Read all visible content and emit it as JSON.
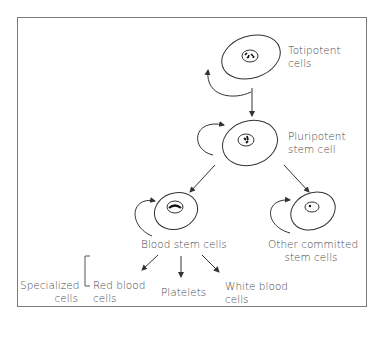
{
  "diagram": {
    "nodes": {
      "totipotent": {
        "line1": "Totipotent",
        "line2": "cells"
      },
      "pluripotent": {
        "line1": "Pluripotent",
        "line2": "stem cell"
      },
      "blood_stem": {
        "label": "Blood stem cells"
      },
      "other_committed": {
        "line1": "Other committed",
        "line2": "stem cells"
      },
      "red_blood": {
        "line1": "Red blood",
        "line2": "cells"
      },
      "platelets": {
        "label": "Platelets"
      },
      "white_blood": {
        "line1": "White blood",
        "line2": "cells"
      }
    },
    "group_label": {
      "line1": "Specialized",
      "line2": "cells"
    },
    "colors": {
      "line": "#333333",
      "text": "#4a4a4a",
      "border": "#7a7a7a"
    }
  }
}
